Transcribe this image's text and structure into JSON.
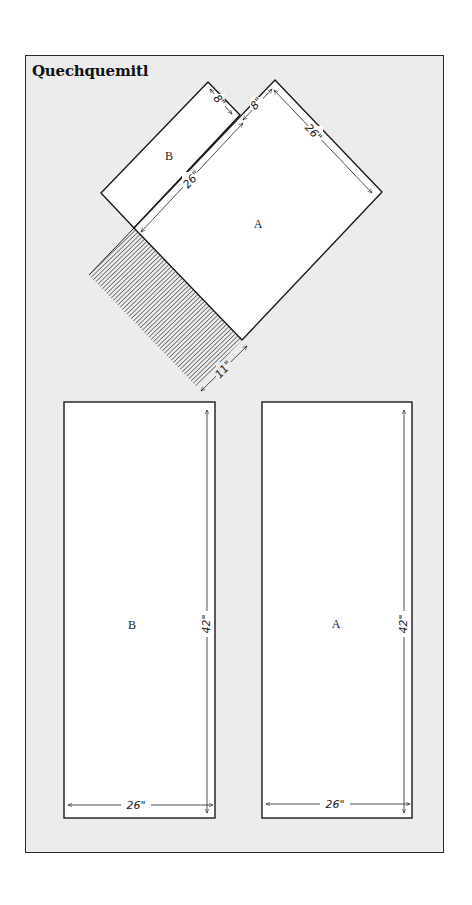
{
  "title": "Quechquemitl",
  "folded_view": {
    "piece_a_label": "A",
    "piece_b_label": "B",
    "dimensions": {
      "b_short_side": "8\"",
      "a_short_offset": "8\"",
      "a_side_right": "26\"",
      "b_long_side": "26\"",
      "hatch_width": "11\""
    }
  },
  "flat_pieces": [
    {
      "label": "B",
      "width_label": "26\"",
      "height_label": "42\""
    },
    {
      "label": "A",
      "width_label": "26\"",
      "height_label": "42\""
    }
  ],
  "colors": {
    "background": "#ececec",
    "piece_fill": "#ffffff",
    "line": "#1a1a1a"
  }
}
